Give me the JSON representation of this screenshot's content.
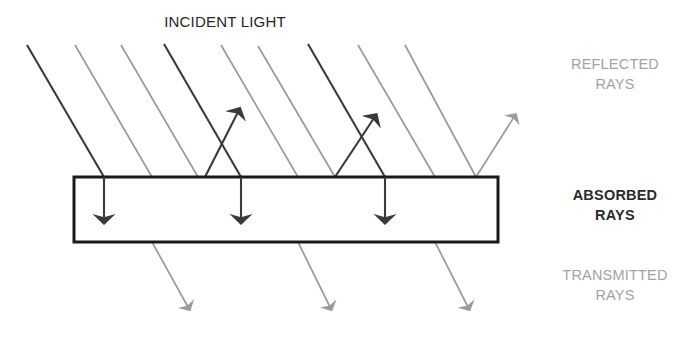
{
  "diagram": {
    "labels": {
      "incident_light": "INCIDENT LIGHT",
      "reflected_rays": "REFLECTED\nRAYS",
      "absorbed_rays": "ABSORBED\nRAYS",
      "transmitted_rays": "TRANSMITTED\nRAYS"
    },
    "colors": {
      "dark_ray": "#3a3a3a",
      "light_ray": "#9a9a9a",
      "slab_outline": "#1a1a1a",
      "slab_fill": "#ffffff",
      "dark_text": "#2b2b2b",
      "gray_text": "#a3a3a3",
      "background": "#ffffff"
    },
    "slab": {
      "x": 74,
      "y": 177,
      "width": 424,
      "height": 65,
      "stroke_width": 3
    },
    "incident_rays": [
      {
        "name": "incident-ray-1",
        "tone": "dark",
        "x1": 27,
        "y1": 45,
        "x2": 104,
        "y2": 177
      },
      {
        "name": "incident-ray-2",
        "tone": "light",
        "x1": 75,
        "y1": 45,
        "x2": 152,
        "y2": 177
      },
      {
        "name": "incident-ray-3",
        "tone": "light",
        "x1": 121,
        "y1": 45,
        "x2": 198,
        "y2": 177
      },
      {
        "name": "incident-ray-4",
        "tone": "dark",
        "x1": 164,
        "y1": 44,
        "x2": 241,
        "y2": 177
      },
      {
        "name": "incident-ray-5",
        "tone": "light",
        "x1": 221,
        "y1": 45,
        "x2": 298,
        "y2": 177
      },
      {
        "name": "incident-ray-6",
        "tone": "light",
        "x1": 258,
        "y1": 46,
        "x2": 335,
        "y2": 177
      },
      {
        "name": "incident-ray-7",
        "tone": "dark",
        "x1": 308,
        "y1": 44,
        "x2": 385,
        "y2": 177
      },
      {
        "name": "incident-ray-8",
        "tone": "light",
        "x1": 358,
        "y1": 45,
        "x2": 435,
        "y2": 177
      },
      {
        "name": "incident-ray-9",
        "tone": "light",
        "x1": 405,
        "y1": 45,
        "x2": 476,
        "y2": 177
      }
    ],
    "reflected_rays": [
      {
        "name": "reflected-ray-1",
        "tone": "dark",
        "x1": 205,
        "y1": 177,
        "x2": 238,
        "y2": 112
      },
      {
        "name": "reflected-ray-2",
        "tone": "dark",
        "x1": 335,
        "y1": 177,
        "x2": 374,
        "y2": 118
      },
      {
        "name": "reflected-ray-3",
        "tone": "light",
        "x1": 476,
        "y1": 177,
        "x2": 514,
        "y2": 117
      }
    ],
    "absorbed_rays": [
      {
        "name": "absorbed-ray-1",
        "tone": "dark",
        "x1": 104,
        "y1": 177,
        "x2": 104,
        "y2": 219
      },
      {
        "name": "absorbed-ray-2",
        "tone": "dark",
        "x1": 241,
        "y1": 177,
        "x2": 241,
        "y2": 219
      },
      {
        "name": "absorbed-ray-3",
        "tone": "dark",
        "x1": 385,
        "y1": 177,
        "x2": 385,
        "y2": 219
      }
    ],
    "transmitted_rays": [
      {
        "name": "transmitted-ray-1",
        "tone": "light",
        "x1": 152,
        "y1": 177,
        "x2": 152,
        "y2": 242,
        "x3": 188,
        "y3": 307
      },
      {
        "name": "transmitted-ray-2",
        "tone": "light",
        "x1": 298,
        "y1": 177,
        "x2": 298,
        "y2": 242,
        "x3": 330,
        "y3": 307
      },
      {
        "name": "transmitted-ray-3",
        "tone": "light",
        "x1": 435,
        "y1": 177,
        "x2": 435,
        "y2": 242,
        "x3": 468,
        "y3": 307
      }
    ]
  }
}
